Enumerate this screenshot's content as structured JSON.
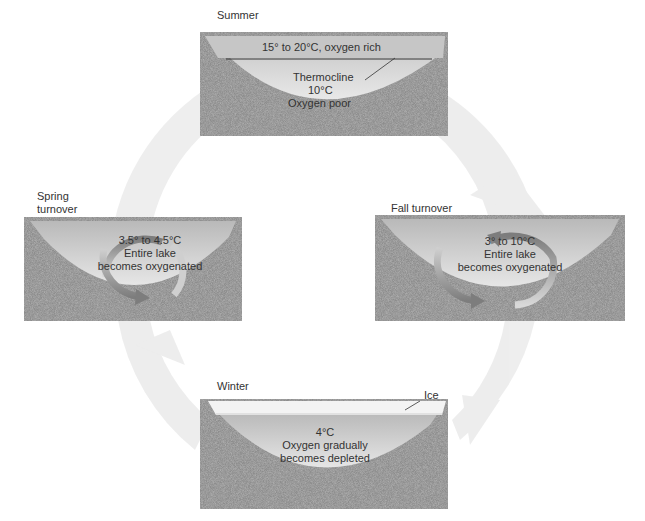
{
  "diagram": {
    "type": "seasonal lake turnover cycle",
    "colors": {
      "background": "#ffffff",
      "cycle_arrow": "#ebebeb",
      "sediment": "#8a8a8a",
      "water_top": "#bdbdbd",
      "water_deep": "#dcdcdc",
      "turnover_arrow": "#8c8c8c",
      "ice": "#f4f4f4"
    },
    "stages": [
      {
        "id": "summer",
        "title": "Summer",
        "surface_label": "15° to 20°C, oxygen rich",
        "thermocline_label": "Thermocline",
        "deep_temp": "10°C",
        "deep_oxygen": "Oxygen poor"
      },
      {
        "id": "fall",
        "title": "Fall turnover",
        "temp": "3° to 10°C",
        "line1": "Entire lake",
        "line2": "becomes oxygenated"
      },
      {
        "id": "winter",
        "title": "Winter",
        "ice_label": "Ice",
        "temp": "4°C",
        "line1": "Oxygen gradually",
        "line2": "becomes depleted"
      },
      {
        "id": "spring",
        "title_line1": "Spring",
        "title_line2": "turnover",
        "temp": "3.5° to 4.5°C",
        "line1": "Entire lake",
        "line2": "becomes oxygenated"
      }
    ]
  }
}
